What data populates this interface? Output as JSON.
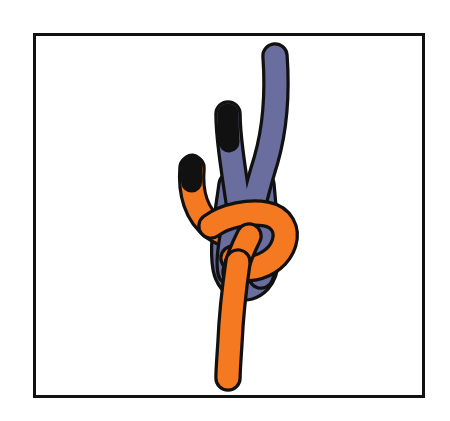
{
  "page": {
    "kind": "knot-tying-illustration",
    "background_color": "#ffffff",
    "width": 450,
    "height": 421
  },
  "frame": {
    "name": "illustration-border",
    "stroke_color": "#111111",
    "fill_color": "#ffffff",
    "stroke_width": 3,
    "x": 33,
    "y": 33,
    "width": 392,
    "height": 365
  },
  "illustration": {
    "title": "Knot diagram with two ropes",
    "description": "An orange rope and a blue-violet rope interlocked in a bend knot. The blue rope forms a bight rising to the upper right with a second blue strand ending in a black-taped tip. The orange rope enters from the upper left with a black-taped tip, wraps around the blue bight, and its working end runs down and out the bottom of the frame.",
    "outline_color": "#111111",
    "outline_width": 3.4
  },
  "ropes": [
    {
      "id": "blue-rope",
      "name": "blue-violet-rope",
      "color": "#6a6e9e",
      "tip_color": "#111111",
      "thickness": 21,
      "strands": [
        {
          "name": "blue-long-standing-part",
          "note": "rises from the knot up to the top right of the frame, no tape on end"
        },
        {
          "name": "blue-short-end",
          "note": "rises from the knot up and slightly left, finished with a black taped tip"
        },
        {
          "name": "blue-bight-loop",
          "note": "rounded bight passing down through the centre of the knot"
        }
      ]
    },
    {
      "id": "orange-rope",
      "name": "orange-rope",
      "color": "#f47920",
      "tip_color": "#111111",
      "thickness": 21,
      "strands": [
        {
          "name": "orange-short-end",
          "note": "curves in from the upper left with a black taped tip"
        },
        {
          "name": "orange-wrap",
          "note": "passes over the blue bight, around the right side and back through"
        },
        {
          "name": "orange-standing-part",
          "note": "runs straight down from the knot toward the bottom of the frame"
        }
      ]
    }
  ],
  "tips": [
    {
      "name": "orange-taped-tip",
      "color": "#111111",
      "x": 190,
      "y": 160
    },
    {
      "name": "blue-taped-tip",
      "color": "#111111",
      "x": 228,
      "y": 112
    }
  ],
  "colors": {
    "orange": "#f47920",
    "blue_violet": "#6a6e9e",
    "outline": "#111111",
    "tape_black": "#111111",
    "paper_white": "#ffffff"
  }
}
